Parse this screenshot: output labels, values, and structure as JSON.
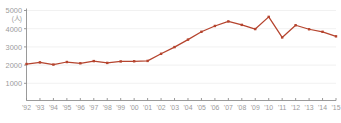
{
  "chart_data": {
    "type": "line",
    "title": "",
    "subtitle": "",
    "xlabel": "",
    "ylabel": "",
    "yunit": "(人)",
    "ylim": [
      0,
      5000
    ],
    "ytick_labels": [
      "5000",
      "4000",
      "3000",
      "2000",
      "1000"
    ],
    "ytick_values": [
      5000,
      4000,
      3000,
      2000,
      1000
    ],
    "grid": true,
    "grid_axis": "y",
    "legend": false,
    "legend_position": "none",
    "series_color": "#b5442e",
    "marker": "square",
    "categories": [
      "'92",
      "'93",
      "'94",
      "'95",
      "'96",
      "'97",
      "'98",
      "'99",
      "'00",
      "'01",
      "'02",
      "'03",
      "'04",
      "'05",
      "'06",
      "'07",
      "'08",
      "'09",
      "'10",
      "'11",
      "'12",
      "'13",
      "'14",
      "'15"
    ],
    "series": [
      {
        "name": "人数",
        "values": [
          2060,
          2150,
          2030,
          2170,
          2100,
          2220,
          2120,
          2200,
          2210,
          2230,
          2620,
          2990,
          3400,
          3830,
          4150,
          4400,
          4210,
          3980,
          4650,
          3520,
          4190,
          3970,
          3830,
          3580
        ]
      }
    ]
  }
}
